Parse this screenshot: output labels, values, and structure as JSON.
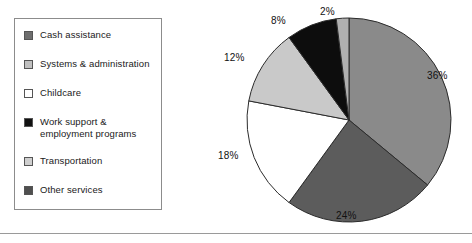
{
  "chart_data": {
    "type": "pie",
    "title": "",
    "xlabel": "",
    "ylabel": "",
    "categories": [
      "Cash assistance",
      "Other services",
      "Childcare",
      "Transportation",
      "Work support & employment programs",
      "Systems & administration"
    ],
    "values": [
      36,
      24,
      18,
      12,
      8,
      2
    ],
    "value_labels": [
      "36%",
      "24%",
      "18%",
      "12%",
      "8%",
      "2%"
    ],
    "units": "percent",
    "legend_position": "left",
    "grid": false,
    "slice_colors": [
      "#8a8a8a",
      "#5c5c5c",
      "#ffffff",
      "#c9c9c9",
      "#0d0d0d",
      "#b0b0b0"
    ],
    "start_angle_deg": 0,
    "direction": "clockwise"
  },
  "legend": {
    "items": [
      {
        "label": "Cash assistance",
        "color": "#6e6e6e",
        "value_pct": 36
      },
      {
        "label": "Systems & administration",
        "color": "#c0c0c0",
        "value_pct": 2
      },
      {
        "label": "Childcare",
        "color": "#ffffff",
        "value_pct": 18
      },
      {
        "label": "Work support &\nemployment programs",
        "color": "#111111",
        "value_pct": 8
      },
      {
        "label": "Transportation",
        "color": "#cfcfcf",
        "value_pct": 12
      },
      {
        "label": "Other services",
        "color": "#4f4f4f",
        "value_pct": 24
      }
    ]
  },
  "pie_labels": [
    {
      "text": "2%",
      "name": "pie-label-2"
    },
    {
      "text": "36%",
      "name": "pie-label-36"
    },
    {
      "text": "24%",
      "name": "pie-label-24"
    },
    {
      "text": "18%",
      "name": "pie-label-18"
    },
    {
      "text": "12%",
      "name": "pie-label-12"
    },
    {
      "text": "8%",
      "name": "pie-label-8"
    }
  ],
  "colors": {
    "slice_cash": "#8a8a8a",
    "slice_other": "#5c5c5c",
    "slice_childcare": "#ffffff",
    "slice_transportation": "#c9c9c9",
    "slice_work_support": "#0d0d0d",
    "slice_systems": "#b0b0b0",
    "outline": "#2b2b2b",
    "legend_border": "#8c8c8c",
    "text": "#1a1a1a"
  }
}
